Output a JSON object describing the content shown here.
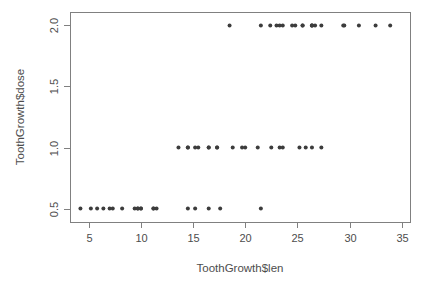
{
  "chart_data": {
    "type": "scatter",
    "title": "",
    "xlabel": "ToothGrowth$len",
    "ylabel": "ToothGrowth$dose",
    "xlim": [
      3.2,
      35.8
    ],
    "ylim": [
      0.39,
      2.11
    ],
    "grid": false,
    "legend": null,
    "xticks": [
      5,
      10,
      15,
      20,
      25,
      30,
      35
    ],
    "xtick_labels": [
      "5",
      "10",
      "15",
      "20",
      "25",
      "30",
      "35"
    ],
    "yticks": [
      0.5,
      1.0,
      1.5,
      2.0
    ],
    "ytick_labels": [
      "0.5",
      "1.0",
      "1.5",
      "2.0"
    ],
    "point_color": "#3c3c3c",
    "point_radius": 2.0,
    "axis_color": "#808080",
    "background": "#ffffff",
    "n_points": 60,
    "series": [
      {
        "name": "dose 0.5",
        "y": 0.5,
        "x": [
          4.2,
          11.5,
          7.3,
          5.8,
          6.4,
          10.0,
          11.2,
          11.2,
          5.2,
          7.0,
          15.2,
          21.5,
          17.6,
          9.7,
          14.5,
          10.0,
          8.2,
          9.4,
          16.5,
          9.7
        ]
      },
      {
        "name": "dose 1.0",
        "y": 1.0,
        "x": [
          16.5,
          16.5,
          15.2,
          17.3,
          22.5,
          17.3,
          13.6,
          14.5,
          18.8,
          15.5,
          19.7,
          23.3,
          23.6,
          26.4,
          20.0,
          25.2,
          25.8,
          21.2,
          14.5,
          27.3
        ]
      },
      {
        "name": "dose 2.0",
        "y": 2.0,
        "x": [
          23.6,
          18.5,
          33.9,
          25.5,
          26.4,
          32.5,
          26.7,
          21.5,
          23.3,
          29.5,
          25.5,
          26.4,
          22.4,
          24.5,
          24.8,
          30.9,
          26.4,
          27.3,
          29.4,
          23.0
        ]
      }
    ]
  },
  "plot_box": {
    "left": 70,
    "right": 410,
    "top": 12,
    "bottom": 222
  },
  "axis": {
    "x_title": "ToothGrowth$len",
    "y_title": "ToothGrowth$dose"
  }
}
